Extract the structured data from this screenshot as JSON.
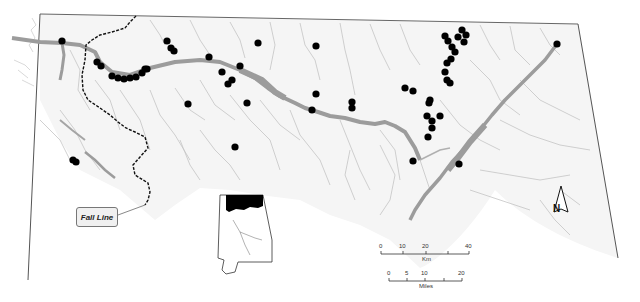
{
  "map": {
    "title": "",
    "labels": {
      "fall_line": "Fall Line",
      "north": "N"
    },
    "scale_bars": [
      {
        "unit": "Km",
        "ticks": [
          "0",
          "10",
          "20",
          "40"
        ]
      },
      {
        "unit": "Miles",
        "ticks": [
          "0",
          "5",
          "10",
          "20"
        ]
      }
    ],
    "colors": {
      "background": "#ffffff",
      "region_fill": "#f4f4f4",
      "border": "#555555",
      "rivers": "#bdbdbd",
      "main_river": "#999999",
      "sites": "#000000",
      "fall_line": "#111111",
      "inset_highlight": "#000000"
    },
    "inset": {
      "description": "Alabama state outline with northern region highlighted in black"
    },
    "site_points": [
      [
        62,
        41
      ],
      [
        97,
        62
      ],
      [
        101,
        66
      ],
      [
        112,
        76
      ],
      [
        118,
        78
      ],
      [
        124,
        79
      ],
      [
        130,
        78
      ],
      [
        136,
        77
      ],
      [
        142,
        73
      ],
      [
        147,
        69
      ],
      [
        145,
        69
      ],
      [
        167,
        41
      ],
      [
        171,
        48
      ],
      [
        174,
        51
      ],
      [
        209,
        57
      ],
      [
        222,
        72
      ],
      [
        228,
        84
      ],
      [
        232,
        80
      ],
      [
        240,
        66
      ],
      [
        258,
        43
      ],
      [
        247,
        103
      ],
      [
        188,
        104
      ],
      [
        235,
        147
      ],
      [
        316,
        46
      ],
      [
        316,
        94
      ],
      [
        312,
        110
      ],
      [
        352,
        102
      ],
      [
        352,
        108
      ],
      [
        405,
        88
      ],
      [
        413,
        91
      ],
      [
        445,
        36
      ],
      [
        448,
        41
      ],
      [
        452,
        47
      ],
      [
        455,
        52
      ],
      [
        458,
        37
      ],
      [
        462,
        30
      ],
      [
        466,
        35
      ],
      [
        464,
        42
      ],
      [
        451,
        59
      ],
      [
        447,
        63
      ],
      [
        445,
        72
      ],
      [
        447,
        80
      ],
      [
        450,
        83
      ],
      [
        430,
        100
      ],
      [
        429,
        103
      ],
      [
        440,
        116
      ],
      [
        427,
        116
      ],
      [
        432,
        121
      ],
      [
        432,
        128
      ],
      [
        428,
        137
      ],
      [
        413,
        161
      ],
      [
        459,
        164
      ],
      [
        557,
        44
      ],
      [
        73,
        160
      ],
      [
        76,
        162
      ]
    ]
  }
}
